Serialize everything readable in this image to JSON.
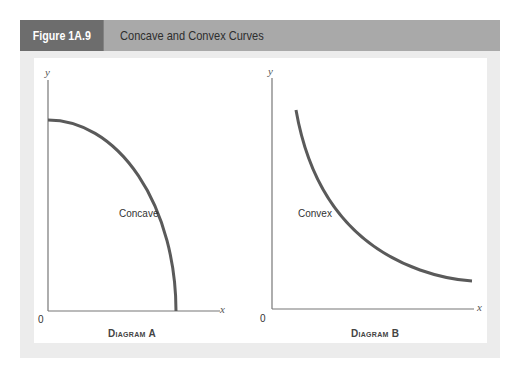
{
  "header": {
    "figure_label": "Figure 1A.9",
    "title": "Concave and Convex Curves"
  },
  "colors": {
    "label_box": "#6d6d6d",
    "title_bar": "#a9a9a9",
    "panel_bg": "#ececec",
    "curve": "#5a5a5a",
    "axis": "#777777"
  },
  "diagrams": [
    {
      "caption": "Diagram A",
      "y_axis_label": "y",
      "x_axis_label": "x",
      "origin_label": "0",
      "curve_label": "Concave",
      "curve_type": "concave"
    },
    {
      "caption": "Diagram B",
      "y_axis_label": "y",
      "x_axis_label": "x",
      "origin_label": "0",
      "curve_label": "Convex",
      "curve_type": "convex"
    }
  ]
}
